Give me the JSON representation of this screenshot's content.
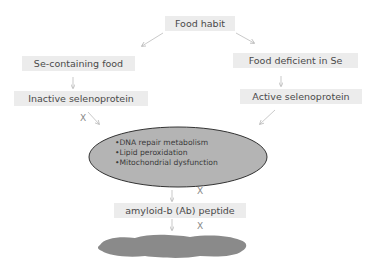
{
  "nodes": {
    "food_habit": "Food habit",
    "se_containing": "Se-containing food",
    "deficient": "Food deficient in Se",
    "inactive": "Inactive selenoprotein",
    "active": "Active selenoprotein",
    "amyloid": "amyloid-b (Ab) peptide"
  },
  "ellipse_items": [
    "•DNA repair metabolism",
    "•Lipid peroxidation",
    "•Mitochondrial dysfunction"
  ],
  "block_mark": "X",
  "colors": {
    "box": "#ececec",
    "ellipse": "#b4b4b4",
    "plaque": "#8a8a8a",
    "arrow": "#aaaaaa"
  }
}
